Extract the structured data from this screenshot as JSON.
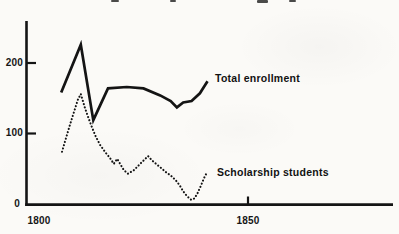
{
  "colors": {
    "ink": "#141414",
    "background": "#fbfaf7"
  },
  "chart_data": {
    "type": "line",
    "title": "",
    "xlabel": "",
    "ylabel": "",
    "xlim": [
      1797,
      1885
    ],
    "ylim": [
      0,
      260
    ],
    "grid": false,
    "legend_position": "inline-labels",
    "x_ticks": [
      {
        "value": 1800,
        "label": "1800"
      },
      {
        "value": 1850,
        "label": "1850"
      }
    ],
    "y_ticks": [
      {
        "value": 0,
        "label": "0"
      },
      {
        "value": 100,
        "label": "100"
      },
      {
        "value": 200,
        "label": "200"
      }
    ],
    "series": [
      {
        "name": "Total enrollment",
        "style": "solid",
        "points": [
          [
            1805.3,
            158
          ],
          [
            1810,
            226
          ],
          [
            1813,
            119
          ],
          [
            1816.5,
            164
          ],
          [
            1821,
            166
          ],
          [
            1825,
            164
          ],
          [
            1829,
            154
          ],
          [
            1831.5,
            146
          ],
          [
            1833,
            137
          ],
          [
            1834.5,
            144
          ],
          [
            1836.5,
            146
          ],
          [
            1838.5,
            157
          ],
          [
            1840.3,
            174
          ]
        ]
      },
      {
        "name": "Scholarship students",
        "style": "dotted",
        "points": [
          [
            1805.5,
            74
          ],
          [
            1807.4,
            112
          ],
          [
            1809.3,
            148
          ],
          [
            1810,
            156
          ],
          [
            1811,
            136
          ],
          [
            1812.2,
            116
          ],
          [
            1813.4,
            98
          ],
          [
            1814.6,
            84
          ],
          [
            1815.8,
            74
          ],
          [
            1817,
            65
          ],
          [
            1817.9,
            57
          ],
          [
            1818.7,
            64
          ],
          [
            1819.4,
            57
          ],
          [
            1820.3,
            48
          ],
          [
            1821.3,
            43
          ],
          [
            1822.7,
            48
          ],
          [
            1824.2,
            57
          ],
          [
            1825.4,
            64
          ],
          [
            1826.1,
            68
          ],
          [
            1827,
            62
          ],
          [
            1828,
            57
          ],
          [
            1829.2,
            51
          ],
          [
            1830.4,
            45
          ],
          [
            1831.6,
            40
          ],
          [
            1832.8,
            33
          ],
          [
            1833.7,
            26
          ],
          [
            1834.5,
            18
          ],
          [
            1835.4,
            11
          ],
          [
            1836.4,
            6
          ],
          [
            1837.2,
            8
          ],
          [
            1838,
            16
          ],
          [
            1838.8,
            27
          ],
          [
            1839.5,
            37
          ],
          [
            1840.2,
            45
          ]
        ]
      }
    ]
  }
}
